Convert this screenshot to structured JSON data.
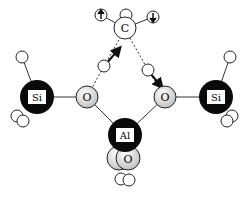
{
  "diagram": {
    "type": "molecular-cluster",
    "colors": {
      "dark_atom": "#0a0a0a",
      "light_atom": "#e6e6e6",
      "hydrogen": "#ffffff",
      "bond": "#333333"
    },
    "atoms": {
      "carbon": {
        "label": "C"
      },
      "o_left": {
        "label": "O"
      },
      "o_right": {
        "label": "O"
      },
      "si_left": {
        "label": "Si"
      },
      "si_right": {
        "label": "Si"
      },
      "aluminum": {
        "label": "Al"
      },
      "o_bottom": {
        "label": "O"
      }
    }
  }
}
